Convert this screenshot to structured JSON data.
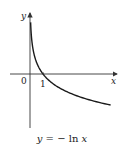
{
  "chart_data": {
    "type": "line",
    "function": "y = -ln(x)",
    "xlabel": "x",
    "ylabel": "y",
    "origin_label": "0",
    "x_tick_labels": [
      "1"
    ],
    "x_ticks": [
      1
    ],
    "xlim": [
      -1.5,
      6.6
    ],
    "ylim": [
      -3.2,
      3.5
    ],
    "grid": false,
    "legend": null,
    "series": [
      {
        "name": "y = -ln x",
        "x": [
          0.05,
          0.1,
          0.2,
          0.3,
          0.5,
          0.75,
          1,
          1.5,
          2,
          3,
          4,
          5,
          6.2
        ],
        "values": [
          3.0,
          2.3,
          1.61,
          1.2,
          0.69,
          0.29,
          0,
          -0.41,
          -0.69,
          -1.1,
          -1.39,
          -1.61,
          -1.82
        ]
      }
    ],
    "annotations": [
      {
        "text": "1",
        "at": [
          1,
          0
        ],
        "note": "x-intercept"
      }
    ]
  },
  "labels": {
    "y_axis": "y",
    "x_axis": "x",
    "origin": "0",
    "tick_one": "1",
    "caption_lhs": "y",
    "caption_eq": " = − ln ",
    "caption_rhs": "x"
  },
  "colors": {
    "curve": "#1a1a1a",
    "axes": "#333333",
    "background": "#ffffff"
  }
}
